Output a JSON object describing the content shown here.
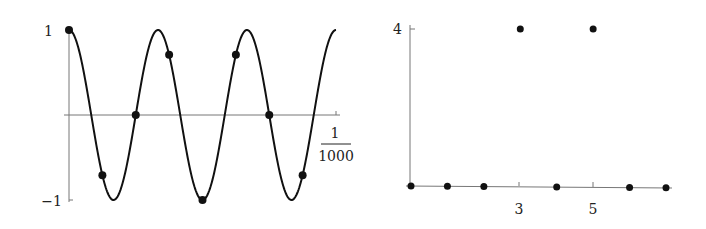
{
  "chart_data": [
    {
      "type": "line",
      "title": "",
      "description": "Cosine wave sampled at discrete points",
      "xlabel": "",
      "ylabel": "",
      "x_tick_labels": {
        "end_numerator": "1",
        "end_denominator": "1000"
      },
      "y_tick_labels": [
        "1",
        "−1"
      ],
      "xlim": [
        0,
        1
      ],
      "ylim": [
        -1,
        1
      ],
      "grid": false,
      "series": [
        {
          "name": "cos(2π·3x)",
          "style": "curve",
          "cycles": 3
        },
        {
          "name": "samples",
          "style": "scatter",
          "x": [
            0,
            0.125,
            0.25,
            0.375,
            0.5,
            0.625,
            0.75,
            0.875
          ],
          "y": [
            1,
            -0.71,
            0,
            0.71,
            -1,
            0.71,
            0,
            -0.71
          ]
        }
      ]
    },
    {
      "type": "scatter",
      "title": "",
      "description": "Discrete spectrum magnitude",
      "xlabel": "",
      "ylabel": "",
      "x_tick_labels": [
        "3",
        "5"
      ],
      "y_tick_labels": [
        "4"
      ],
      "xlim": [
        0,
        7
      ],
      "ylim": [
        0,
        4
      ],
      "grid": false,
      "series": [
        {
          "name": "spectrum",
          "x": [
            0,
            1,
            2,
            3,
            4,
            5,
            6,
            7
          ],
          "y": [
            0,
            0,
            0,
            4,
            0,
            4,
            0,
            0
          ]
        }
      ]
    }
  ],
  "labels": {
    "left_y_top": "1",
    "left_y_bottom": "−1",
    "left_x_num": "1",
    "left_x_den": "1000",
    "right_y_top": "4",
    "right_x_3": "3",
    "right_x_5": "5"
  }
}
